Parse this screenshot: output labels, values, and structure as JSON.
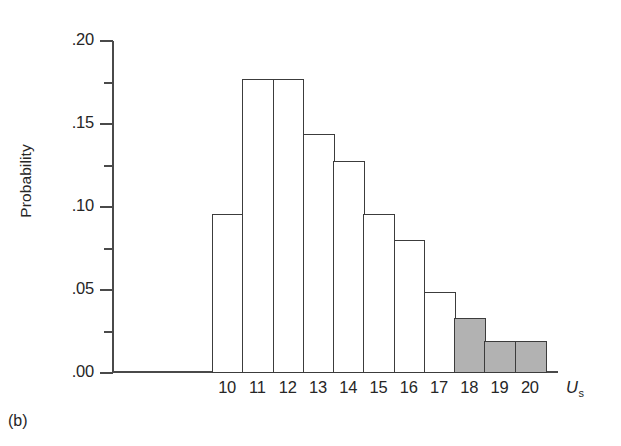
{
  "panel": {
    "label": "(b)"
  },
  "chart_data": {
    "type": "bar",
    "title": "",
    "subtitle": "",
    "xlabel": "U_s",
    "xlabel_base": "U",
    "xlabel_sub": "s",
    "ylabel": "Probability",
    "categories": [
      "10",
      "11",
      "12",
      "13",
      "14",
      "15",
      "16",
      "17",
      "18",
      "19",
      "20"
    ],
    "values": [
      0.096,
      0.177,
      0.177,
      0.144,
      0.128,
      0.096,
      0.08,
      0.049,
      0.033,
      0.019,
      0.019
    ],
    "shaded": [
      false,
      false,
      false,
      false,
      false,
      false,
      false,
      false,
      true,
      true,
      true
    ],
    "shaded_categories": [
      "18",
      "19",
      "20"
    ],
    "ylim": [
      0.0,
      0.2
    ],
    "xlim": [
      9.5,
      20.5
    ],
    "y_major_ticks": [
      0.0,
      0.05,
      0.1,
      0.15,
      0.2
    ],
    "y_major_tick_labels": [
      ".00",
      ".05",
      ".10",
      ".15",
      ".20"
    ],
    "y_minor_ticks": [
      0.025,
      0.075,
      0.125,
      0.175
    ],
    "grid": false,
    "legend": "none",
    "bar_fill_unshaded": "#ffffff",
    "bar_fill_shaded": "#b2b2b2",
    "bar_edge_color": "#3c3c3c",
    "axis_color": "#4a4a4a"
  }
}
